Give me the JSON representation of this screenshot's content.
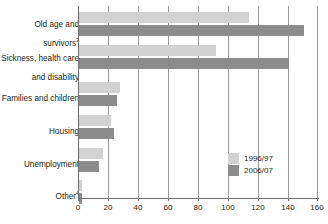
{
  "chart_data": {
    "type": "bar",
    "orientation": "horizontal",
    "title": "",
    "xlabel": "",
    "ylabel": "",
    "xlim": [
      0,
      160
    ],
    "xticks": [
      0,
      20,
      40,
      60,
      80,
      100,
      120,
      140,
      160
    ],
    "xtick_labels": [
      "0",
      "20",
      "40",
      "60",
      "80",
      "100",
      "120",
      "140",
      "160"
    ],
    "grid": true,
    "legend_position": "bottom-right",
    "categories": [
      "Old age and\nsurvivors",
      "Sickness, health care\nand disability",
      "Families and children",
      "Housing",
      "Unemployment",
      "Other"
    ],
    "category_footnotes": [
      "3",
      "",
      "",
      "",
      "",
      "4"
    ],
    "series": [
      {
        "name": "1996/97",
        "color": "#d2d2d2",
        "values": [
          113,
          91,
          27,
          21,
          16,
          2
        ]
      },
      {
        "name": "2006/07",
        "color": "#8c8c8c",
        "values": [
          150,
          140,
          25,
          23,
          13,
          2
        ]
      }
    ]
  },
  "legend": {
    "items": [
      {
        "label": "1996/97",
        "color": "#d2d2d2"
      },
      {
        "label": "2006/07",
        "color": "#8c8c8c"
      }
    ]
  },
  "axis": {
    "tick_labels": [
      "0",
      "20",
      "40",
      "60",
      "80",
      "100",
      "120",
      "140",
      "160"
    ]
  },
  "categories": [
    {
      "line1": "Old age and",
      "line2": "survivors",
      "footnote": "3"
    },
    {
      "line1": "Sickness, health care",
      "line2": "and disability",
      "footnote": ""
    },
    {
      "line1": "Families and children",
      "line2": "",
      "footnote": ""
    },
    {
      "line1": "Housing",
      "line2": "",
      "footnote": ""
    },
    {
      "line1": "Unemployment",
      "line2": "",
      "footnote": ""
    },
    {
      "line1": "Other",
      "line2": "",
      "footnote": "4"
    }
  ]
}
